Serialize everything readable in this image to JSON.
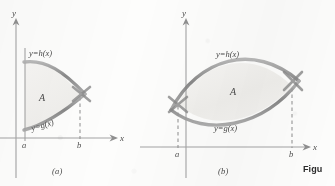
{
  "figure": {
    "caption_word": "Figu",
    "panels": [
      {
        "id": "a",
        "caption": "(a)",
        "axis_y_label": "y",
        "axis_x_label": "x",
        "upper_curve_label": "y=h(x)",
        "lower_curve_label": "y=g(x)",
        "region_label": "A",
        "tick_left_label": "a",
        "tick_right_label": "b",
        "description": "Region A bounded left by vertical line x=a, above by y=h(x), below by y=g(x), closing where the curves cross at x=b",
        "intersections": 1,
        "dashed_verticals": [
          "b"
        ]
      },
      {
        "id": "b",
        "caption": "(b)",
        "axis_y_label": "y",
        "axis_x_label": "x",
        "upper_curve_label": "y=h(x)",
        "lower_curve_label": "y=g(x)",
        "region_label": "A",
        "tick_left_label": "a",
        "tick_right_label": "b",
        "description": "Lens shaped region A where y=h(x) and y=g(x) cross at x=a and x=b",
        "intersections": 2,
        "dashed_verticals": [
          "a",
          "b"
        ]
      }
    ],
    "colors": {
      "curve": "#8a8a8a",
      "axis": "#9a9a9a",
      "label": "#4a4a4a",
      "shading": "#f2f1ef",
      "paper": "#fdfdfc"
    }
  }
}
